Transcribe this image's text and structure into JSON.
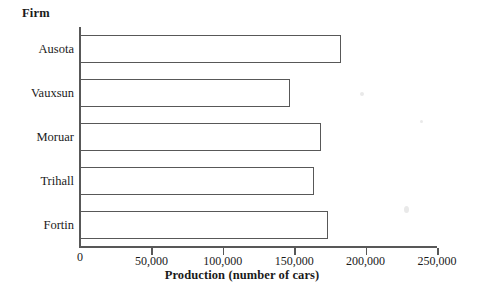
{
  "chart_data": {
    "type": "bar",
    "orientation": "horizontal",
    "title": "",
    "xlabel": "Production (number of cars)",
    "ylabel": "Firm",
    "categories": [
      "Ausota",
      "Vauxsun",
      "Moruar",
      "Trihall",
      "Fortin"
    ],
    "values": [
      183000,
      147000,
      169000,
      164000,
      174000
    ],
    "xlim": [
      0,
      250000
    ],
    "xticks": [
      0,
      50000,
      100000,
      150000,
      200000,
      250000
    ],
    "xtick_labels": [
      "0",
      "50,000",
      "100,000",
      "150,000",
      "200,000",
      "250,000"
    ],
    "grid": false,
    "legend": false,
    "bar_fill": "#ffffff",
    "bar_edge": "#585858",
    "axis_color": "#585858"
  },
  "axes": {
    "y_title": "Firm",
    "x_title": "Production (number of cars)"
  },
  "ticks": {
    "x": [
      {
        "label": "0",
        "value": 0
      },
      {
        "label": "50,000",
        "value": 50000
      },
      {
        "label": "100,000",
        "value": 100000
      },
      {
        "label": "150,000",
        "value": 150000
      },
      {
        "label": "200,000",
        "value": 200000
      },
      {
        "label": "250,000",
        "value": 250000
      }
    ]
  }
}
